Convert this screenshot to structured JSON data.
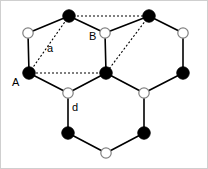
{
  "figure": {
    "type": "lattice-diagram",
    "width": 208,
    "height": 169,
    "background_color": "#ffffff",
    "border_color": "#cfcfcf"
  },
  "style": {
    "filled_node_fill": "#000000",
    "filled_node_stroke": "#000000",
    "open_node_fill": "#ffffff",
    "open_node_stroke": "#808080",
    "bond_color": "#000000",
    "bond_width": 1.6,
    "dashed_color": "#000000",
    "dashed_width": 1.1,
    "dash_pattern": "2,2",
    "filled_radius": 6.2,
    "open_radius": 5.2,
    "label_color": "#000000"
  },
  "labels": [
    {
      "id": "label-A",
      "text": "A",
      "x": 11,
      "y": 76
    },
    {
      "id": "label-B",
      "text": "B",
      "x": 88,
      "y": 30
    },
    {
      "id": "label-a",
      "text": "a",
      "x": 46,
      "y": 42
    },
    {
      "id": "label-d",
      "text": "d",
      "x": 71,
      "y": 101
    }
  ],
  "nodes": {
    "filled": [
      {
        "id": "node-top-left",
        "x": 68,
        "y": 15
      },
      {
        "id": "node-top-right",
        "x": 148,
        "y": 15
      },
      {
        "id": "node-A",
        "x": 28,
        "y": 72
      },
      {
        "id": "node-center",
        "x": 105,
        "y": 72
      },
      {
        "id": "node-right",
        "x": 182,
        "y": 72
      },
      {
        "id": "node-bottom-left",
        "x": 67,
        "y": 132
      },
      {
        "id": "node-bottom-right",
        "x": 143,
        "y": 132
      }
    ],
    "open": [
      {
        "id": "open-upper-left",
        "x": 27,
        "y": 32
      },
      {
        "id": "open-B",
        "x": 104,
        "y": 32
      },
      {
        "id": "open-upper-right",
        "x": 182,
        "y": 32
      },
      {
        "id": "open-lower-left",
        "x": 67,
        "y": 92
      },
      {
        "id": "open-lower-right",
        "x": 143,
        "y": 92
      },
      {
        "id": "open-bottom",
        "x": 105,
        "y": 152
      }
    ]
  },
  "bonds": [
    {
      "id": "bond-topleft-openupperleft",
      "x1": 68,
      "y1": 15,
      "x2": 27,
      "y2": 32
    },
    {
      "id": "bond-topleft-openB",
      "x1": 68,
      "y1": 15,
      "x2": 104,
      "y2": 32
    },
    {
      "id": "bond-topright-openB",
      "x1": 148,
      "y1": 15,
      "x2": 104,
      "y2": 32
    },
    {
      "id": "bond-topright-openupperright",
      "x1": 148,
      "y1": 15,
      "x2": 182,
      "y2": 32
    },
    {
      "id": "bond-openupperleft-A",
      "x1": 27,
      "y1": 32,
      "x2": 28,
      "y2": 72
    },
    {
      "id": "bond-openB-center",
      "x1": 104,
      "y1": 32,
      "x2": 105,
      "y2": 72
    },
    {
      "id": "bond-openupperright-right",
      "x1": 182,
      "y1": 32,
      "x2": 182,
      "y2": 72
    },
    {
      "id": "bond-A-openlowerleft",
      "x1": 28,
      "y1": 72,
      "x2": 67,
      "y2": 92
    },
    {
      "id": "bond-center-openlowerleft",
      "x1": 105,
      "y1": 72,
      "x2": 67,
      "y2": 92
    },
    {
      "id": "bond-center-openlowerright",
      "x1": 105,
      "y1": 72,
      "x2": 143,
      "y2": 92
    },
    {
      "id": "bond-right-openlowerright",
      "x1": 182,
      "y1": 72,
      "x2": 143,
      "y2": 92
    },
    {
      "id": "bond-openlowerleft-bottomleft",
      "x1": 67,
      "y1": 92,
      "x2": 67,
      "y2": 132
    },
    {
      "id": "bond-openlowerright-bottomright",
      "x1": 143,
      "y1": 92,
      "x2": 143,
      "y2": 132
    },
    {
      "id": "bond-bottomleft-openbottom",
      "x1": 67,
      "y1": 132,
      "x2": 105,
      "y2": 152
    },
    {
      "id": "bond-bottomright-openbottom",
      "x1": 143,
      "y1": 132,
      "x2": 105,
      "y2": 152
    }
  ],
  "dashed_bonds": [
    {
      "id": "dash-A-topleft",
      "x1": 28,
      "y1": 72,
      "x2": 68,
      "y2": 15
    },
    {
      "id": "dash-topleft-topright",
      "x1": 68,
      "y1": 15,
      "x2": 148,
      "y2": 15
    },
    {
      "id": "dash-topright-center",
      "x1": 148,
      "y1": 15,
      "x2": 105,
      "y2": 72
    },
    {
      "id": "dash-center-A",
      "x1": 105,
      "y1": 72,
      "x2": 28,
      "y2": 72
    }
  ]
}
